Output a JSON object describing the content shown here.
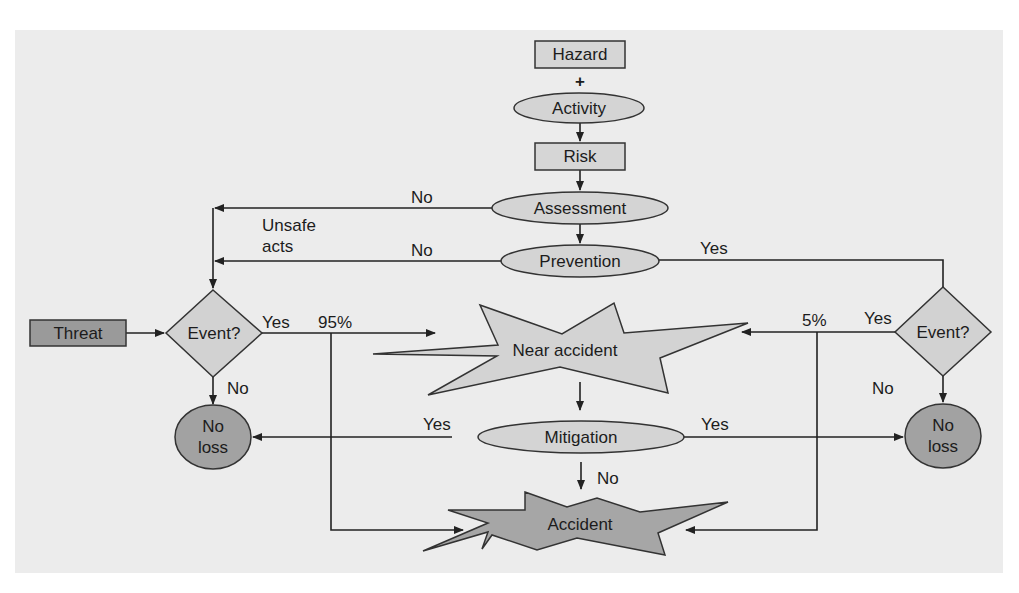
{
  "diagram": {
    "colors": {
      "background": "#ececec",
      "node_light": "#d4d4d4",
      "node_dark": "#9a9a9a",
      "line": "#222222"
    },
    "nodes": {
      "hazard": "Hazard",
      "plus": "+",
      "activity": "Activity",
      "risk": "Risk",
      "assessment": "Assessment",
      "prevention": "Prevention",
      "threat": "Threat",
      "event_left": "Event?",
      "event_right": "Event?",
      "near_accident": "Near accident",
      "mitigation": "Mitigation",
      "accident": "Accident",
      "no_loss_left_line1": "No",
      "no_loss_left_line2": "loss",
      "no_loss_right_line1": "No",
      "no_loss_right_line2": "loss"
    },
    "edge_labels": {
      "assessment_no": "No",
      "unsafe_acts_line1": "Unsafe",
      "unsafe_acts_line2": "acts",
      "prevention_no": "No",
      "prevention_yes": "Yes",
      "event_left_yes": "Yes",
      "pct_95": "95%",
      "event_left_no": "No",
      "pct_5": "5%",
      "event_right_yes": "Yes",
      "event_right_no": "No",
      "mitigation_yes_left": "Yes",
      "mitigation_yes_right": "Yes",
      "mitigation_no": "No"
    }
  }
}
